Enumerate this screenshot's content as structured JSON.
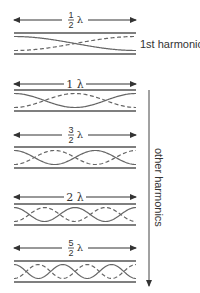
{
  "diagram": {
    "title_hint": "Standing waves in a tube open at both ends",
    "colors": {
      "line": "#555555",
      "wave": "#666666",
      "text": "#333333",
      "background": "#ffffff"
    },
    "tube": {
      "x_left": 14,
      "x_right": 136,
      "height": 21
    },
    "harmonics": [
      {
        "label_num": "1",
        "label_den": "2",
        "label_text": "½ λ",
        "fraction": true,
        "arrow_y": 20,
        "tube_top": 33,
        "half_waves": 1,
        "side_label": "1st harmonic"
      },
      {
        "label_whole": "1",
        "label_text": "1 λ",
        "fraction": false,
        "arrow_y": 84,
        "tube_top": 90,
        "half_waves": 2
      },
      {
        "label_num": "3",
        "label_den": "2",
        "label_text": "3/2 λ",
        "fraction": true,
        "arrow_y": 135,
        "tube_top": 147,
        "half_waves": 3
      },
      {
        "label_whole": "2",
        "label_text": "2 λ",
        "fraction": false,
        "arrow_y": 197,
        "tube_top": 204,
        "half_waves": 4
      },
      {
        "label_num": "5",
        "label_den": "2",
        "label_text": "5/2 λ",
        "fraction": true,
        "arrow_y": 248,
        "tube_top": 261,
        "half_waves": 5
      }
    ],
    "lambda_symbol": "λ",
    "first_harmonic_label": "1st harmonic",
    "other_harmonics_label": "other harmonics",
    "side_arrow": {
      "x": 149,
      "y_top": 90,
      "y_bottom": 286
    }
  }
}
